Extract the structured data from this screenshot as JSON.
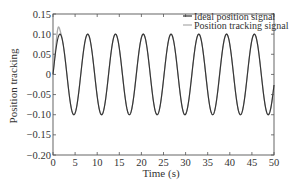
{
  "chart_data": {
    "type": "line",
    "title": "",
    "xlabel": "Time (s)",
    "ylabel": "Position tracking",
    "xlim": [
      0,
      50
    ],
    "ylim": [
      -0.2,
      0.15
    ],
    "grid": false,
    "legend_position": "upper right (inside)",
    "x_ticks": [
      0,
      5,
      10,
      15,
      20,
      25,
      30,
      35,
      40,
      45,
      50
    ],
    "x_tick_labels": [
      "0",
      "5",
      "10",
      "15",
      "20",
      "25",
      "30",
      "35",
      "40",
      "45",
      "50"
    ],
    "y_ticks": [
      0.15,
      0.1,
      0.05,
      0,
      -0.05,
      -0.1,
      -0.15,
      -0.2
    ],
    "y_tick_labels": [
      "0.15",
      "0.10",
      "0.05",
      "0",
      "−0.05",
      "−0.10",
      "−0.15",
      "−0.20"
    ],
    "series": [
      {
        "name": "Ideal position signal",
        "color": "#333333",
        "function": "0.1*sin(t)",
        "amplitude": 0.1,
        "period_s": 6.28,
        "x": [
          0,
          1.57,
          4.71,
          7.85,
          11.0,
          14.1,
          17.3,
          20.4,
          23.6,
          26.7,
          29.8,
          33.0,
          36.1,
          39.3,
          42.4,
          45.6,
          48.7,
          50
        ],
        "values": [
          0,
          0.1,
          -0.1,
          0.1,
          -0.1,
          0.1,
          -0.1,
          0.1,
          -0.1,
          0.1,
          -0.1,
          0.1,
          -0.1,
          0.1,
          -0.1,
          0.1,
          -0.1,
          -0.026
        ]
      },
      {
        "name": "Position tracking signal",
        "color": "#aaaaaa",
        "function": "≈0.1*sin(t) with initial transient overshoot to ≈0.12 near t≈1",
        "x": [
          0,
          0.5,
          1.0,
          1.57,
          4.71,
          7.85,
          11.0,
          14.1,
          17.3,
          20.4,
          23.6,
          26.7,
          29.8,
          33.0,
          36.1,
          39.3,
          42.4,
          45.6,
          48.7,
          50
        ],
        "values": [
          0,
          0.06,
          0.12,
          0.1,
          -0.1,
          0.1,
          -0.1,
          0.1,
          -0.1,
          0.1,
          -0.1,
          0.1,
          -0.1,
          0.1,
          -0.1,
          0.1,
          -0.1,
          0.1,
          -0.1,
          -0.026
        ]
      }
    ]
  }
}
